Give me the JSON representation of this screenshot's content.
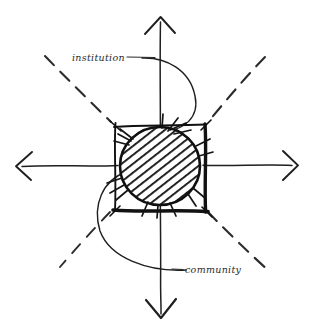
{
  "diagram": {
    "type": "hand-drawn-sketch",
    "background_color": "#ffffff",
    "ink_color": "#1a1a1a",
    "labels": {
      "institution": "institution",
      "community": "community"
    },
    "axes": {
      "vertical": {
        "name": "vertical-axis",
        "style": "solid",
        "arrowheads": "both",
        "top_point": [
          160,
          16
        ],
        "bottom_point": [
          161,
          318
        ]
      },
      "horizontal": {
        "name": "horizontal-axis",
        "style": "solid",
        "arrowheads": "both",
        "left_point": [
          16,
          166
        ],
        "right_point": [
          298,
          165
        ]
      }
    },
    "diagonals": {
      "style": "dashed",
      "count": 4,
      "directions": [
        "upper-left",
        "upper-right",
        "lower-left",
        "lower-right"
      ]
    },
    "center_motif": {
      "square": {
        "name": "center-square",
        "x": 115,
        "y": 125,
        "width": 90,
        "height": 85,
        "stroke": "heavy-hand-drawn"
      },
      "circle": {
        "name": "hatched-circle",
        "cx": 160,
        "cy": 166,
        "r": 39,
        "fill": "diagonal-hatching",
        "hatch_direction": "top-left-to-bottom-right",
        "spikes": true
      }
    },
    "scurve": {
      "name": "s-curve",
      "description": "sinuous curve passing through center, bulging right above and left below"
    }
  }
}
